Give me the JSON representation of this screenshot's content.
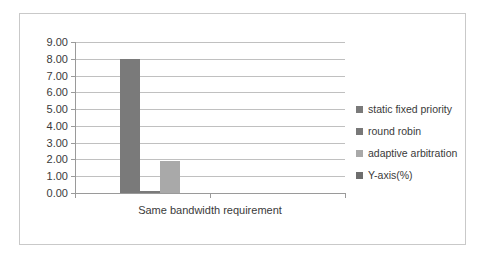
{
  "chart_data": {
    "type": "bar",
    "title": "",
    "subtitle": "",
    "xlabel": "Same bandwidth requirement",
    "ylabel": "",
    "categories": [
      "Same bandwidth requirement",
      ""
    ],
    "ylim": [
      0,
      9
    ],
    "ytick_step": 1,
    "ytick_labels": [
      "9.00",
      "8.00",
      "7.00",
      "6.00",
      "5.00",
      "4.00",
      "3.00",
      "2.00",
      "1.00",
      "0.00"
    ],
    "grid": true,
    "legend_position": "right",
    "series": [
      {
        "name": "static fixed priority",
        "color": "#7a7a7a",
        "values": [
          8.0,
          null
        ]
      },
      {
        "name": "round robin",
        "color": "#7a7a7a",
        "values": [
          0.1,
          null
        ]
      },
      {
        "name": "adaptive arbitration",
        "color": "#a9a9a9",
        "values": [
          1.9,
          null
        ]
      },
      {
        "name": "Y-axis(%)",
        "color": "#6e6e6e",
        "values": [
          null,
          null
        ]
      }
    ]
  },
  "legend": {
    "items": [
      {
        "label": "static fixed priority",
        "color": "#7a7a7a"
      },
      {
        "label": "round robin",
        "color": "#787878"
      },
      {
        "label": "adaptive arbitration",
        "color": "#a9a9a9"
      },
      {
        "label": "Y-axis(%)",
        "color": "#6e6e6e"
      }
    ]
  },
  "axis": {
    "x_label": "Same bandwidth requirement",
    "y_labels": [
      "9.00",
      "8.00",
      "7.00",
      "6.00",
      "5.00",
      "4.00",
      "3.00",
      "2.00",
      "1.00",
      "0.00"
    ]
  },
  "colors": {
    "frame": "#c9c9c9",
    "gridline": "#c0c0c0",
    "axis": "#9a9a9a",
    "text": "#3a3a3a",
    "background": "#ffffff"
  }
}
